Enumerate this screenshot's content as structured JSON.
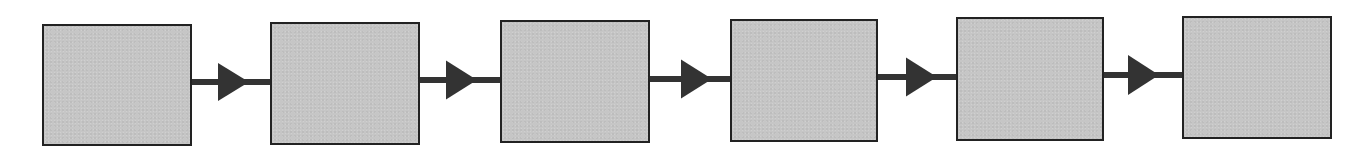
{
  "diagram": {
    "type": "linear-flow",
    "direction": "left-to-right",
    "colors": {
      "background": "#ffffff",
      "box_fill": "#c6c6c6",
      "box_border": "#222222",
      "arrow": "#333333"
    },
    "nodes": [
      {
        "id": "node-1",
        "label": "",
        "x": 42,
        "y": 24,
        "w": 150,
        "h": 122
      },
      {
        "id": "node-2",
        "label": "",
        "x": 270,
        "y": 22,
        "w": 150,
        "h": 123
      },
      {
        "id": "node-3",
        "label": "",
        "x": 500,
        "y": 20,
        "w": 150,
        "h": 123
      },
      {
        "id": "node-4",
        "label": "",
        "x": 730,
        "y": 19,
        "w": 148,
        "h": 123
      },
      {
        "id": "node-5",
        "label": "",
        "x": 956,
        "y": 17,
        "w": 148,
        "h": 124
      },
      {
        "id": "node-6",
        "label": "",
        "x": 1182,
        "y": 16,
        "w": 150,
        "h": 123
      }
    ],
    "edges": [
      {
        "from": "node-1",
        "to": "node-2",
        "line_y": 82,
        "x1": 192,
        "x2": 270,
        "tri_x": 218,
        "tri_w": 31,
        "tri_h": 38
      },
      {
        "from": "node-2",
        "to": "node-3",
        "line_y": 80,
        "x1": 420,
        "x2": 500,
        "tri_x": 446,
        "tri_w": 31,
        "tri_h": 39
      },
      {
        "from": "node-3",
        "to": "node-4",
        "line_y": 79,
        "x1": 650,
        "x2": 730,
        "tri_x": 681,
        "tri_w": 31,
        "tri_h": 39
      },
      {
        "from": "node-4",
        "to": "node-5",
        "line_y": 77,
        "x1": 878,
        "x2": 956,
        "tri_x": 906,
        "tri_w": 31,
        "tri_h": 39
      },
      {
        "from": "node-5",
        "to": "node-6",
        "line_y": 75,
        "x1": 1104,
        "x2": 1182,
        "tri_x": 1128,
        "tri_w": 31,
        "tri_h": 40
      }
    ]
  }
}
